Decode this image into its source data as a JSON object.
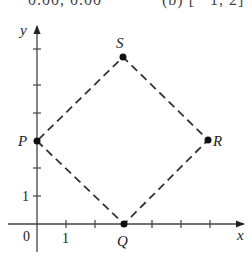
{
  "cropped_header": {
    "left_fragment": "0.00, 0.00",
    "right_fragment": "(b) [ −1, 2]"
  },
  "diagram": {
    "axes": {
      "x_label": "x",
      "y_label": "y",
      "origin_label": "0",
      "x_tick_label": "1",
      "y_tick_label": "1",
      "x_ticks": [
        1,
        2,
        3,
        4,
        5,
        6
      ],
      "y_ticks": [
        1,
        2,
        3,
        4,
        5,
        6
      ]
    },
    "points": [
      {
        "label": "P",
        "x": 0,
        "y": 3
      },
      {
        "label": "Q",
        "x": 3,
        "y": 0
      },
      {
        "label": "R",
        "x": 6,
        "y": 3
      },
      {
        "label": "S",
        "x": 3,
        "y": 6
      }
    ],
    "polygon_order": [
      "P",
      "Q",
      "R",
      "S"
    ],
    "line_style": "dashed"
  }
}
